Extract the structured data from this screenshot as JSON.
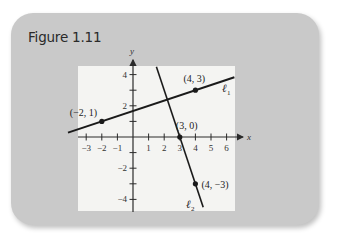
{
  "figure": {
    "title": "Figure 1.11"
  },
  "colors": {
    "card_bg": "#c9c9c9",
    "plot_bg": "#f4f4f2",
    "line": "#1a1a1a",
    "axis": "#2a2a2a"
  },
  "chart_data": {
    "type": "line",
    "title": "Figure 1.11",
    "xlabel": "x",
    "ylabel": "y",
    "xlim": [
      -3.3,
      6.5
    ],
    "ylim": [
      -4.5,
      4.5
    ],
    "grid": false,
    "x_ticks": [
      -3,
      -2,
      -1,
      1,
      2,
      3,
      4,
      5,
      6
    ],
    "x_tick_labels": [
      "−3",
      "−2",
      "−1",
      "1",
      "2",
      "3",
      "4",
      "5",
      "6"
    ],
    "y_ticks": [
      -4,
      -3,
      -2,
      -1,
      1,
      2,
      3,
      4
    ],
    "y_tick_labels": [
      "−4",
      "",
      "−2",
      "",
      "",
      "2",
      "",
      "4"
    ],
    "series": [
      {
        "name": "ℓ1",
        "label_main": "ℓ",
        "label_sub": "1",
        "slope": 0.3333,
        "intercept": 1.6667,
        "x": [
          -3.3,
          6.5
        ],
        "y": [
          0.5667,
          3.8333
        ],
        "points": [
          {
            "x": -2,
            "y": 1,
            "label": "(−2, 1)"
          },
          {
            "x": 4,
            "y": 3,
            "label": "(4, 3)"
          }
        ]
      },
      {
        "name": "ℓ2",
        "label_main": "ℓ",
        "label_sub": "2",
        "slope": -3,
        "intercept": 9,
        "x": [
          1.5,
          4.5
        ],
        "y": [
          4.5,
          -4.5
        ],
        "points": [
          {
            "x": 3,
            "y": 0,
            "label": "(3, 0)"
          },
          {
            "x": 4,
            "y": -3,
            "label": "(4, −3)"
          }
        ]
      }
    ]
  }
}
